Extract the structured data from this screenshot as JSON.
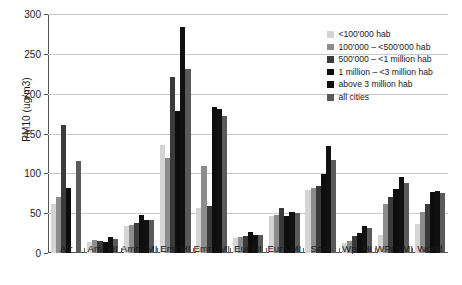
{
  "chart_data": {
    "type": "bar",
    "title": "",
    "xlabel": "",
    "ylabel": "PM10 (ug/m3)",
    "ylim": [
      0,
      300
    ],
    "yticks": [
      0,
      50,
      100,
      150,
      200,
      250,
      300
    ],
    "grid": true,
    "legend_position": "top-right",
    "categories": [
      "Afr",
      "Amr HI",
      "Amr LMI",
      "Emr HI",
      "Emr LMI",
      "Eur HI",
      "Eur LMI",
      "Sear",
      "Wpr HI",
      "WPr LMI",
      "World"
    ],
    "series": [
      {
        "name": "<100'000 hab",
        "color": "#d4d4d4",
        "values": [
          62,
          14,
          34,
          135,
          56,
          19,
          47,
          79,
          12,
          23,
          37
        ]
      },
      {
        "name": "100'000 – <500'000 hab",
        "color": "#8c8c8c",
        "values": [
          70,
          16,
          35,
          119,
          109,
          20,
          48,
          82,
          15,
          61,
          51
        ]
      },
      {
        "name": "500'000 – <1 million hab",
        "color": "#3a3a3a",
        "values": [
          161,
          15,
          38,
          221,
          59,
          21,
          57,
          84,
          21,
          70,
          61
        ]
      },
      {
        "name": "1 million – <3 million hab",
        "color": "#0d0d0d",
        "values": [
          82,
          14,
          48,
          178,
          183,
          26,
          46,
          99,
          25,
          80,
          77
        ]
      },
      {
        "name": "above 3 million hab",
        "color": "#111111",
        "values": [
          0,
          20,
          41,
          284,
          181,
          22,
          52,
          134,
          34,
          95,
          78
        ]
      },
      {
        "name": "all cities",
        "color": "#5a5a5a",
        "values": [
          116,
          18,
          42,
          231,
          172,
          22,
          50,
          117,
          32,
          88,
          75
        ]
      }
    ]
  },
  "axis": {
    "y_title": "PM10 (ug/m3)",
    "y_tick_labels": [
      "300",
      "250",
      "200",
      "150",
      "100",
      "50",
      "0"
    ]
  },
  "legend": {
    "items": [
      {
        "label": "<100'000 hab"
      },
      {
        "label": "100'000 – <500'000 hab"
      },
      {
        "label": "500'000 – <1 million hab"
      },
      {
        "label": "1 million – <3 million hab"
      },
      {
        "label": "above 3 million hab"
      },
      {
        "label": "all cities"
      }
    ]
  }
}
